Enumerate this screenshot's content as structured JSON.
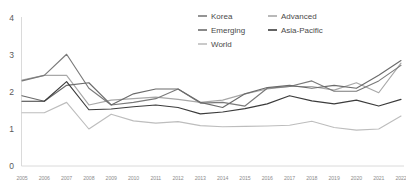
{
  "chart_data": {
    "type": "line",
    "title": "",
    "subtitle": "",
    "xlabel": "",
    "ylabel": "",
    "ylim": [
      0,
      4
    ],
    "yticks": [
      "0",
      "1",
      "2",
      "3",
      "4"
    ],
    "ytick_values": [
      0,
      1,
      2,
      3,
      4
    ],
    "grid": false,
    "legend_position": "top-center",
    "x": [
      "2005",
      "2006",
      "2007",
      "2008",
      "2009",
      "2010",
      "2011",
      "2012",
      "2013",
      "2014",
      "2015",
      "2016",
      "2017",
      "2018",
      "2019",
      "2020",
      "2021",
      "2022"
    ],
    "categories": [
      "2005",
      "2006",
      "2007",
      "2008",
      "2009",
      "2010",
      "2011",
      "2012",
      "2013",
      "2014",
      "2015",
      "2016",
      "2017",
      "2018",
      "2019",
      "2020",
      "2021",
      "2022"
    ],
    "series": [
      {
        "name": "Korea",
        "color": "#7a7a7a",
        "values": [
          2.3,
          2.45,
          3.02,
          2.1,
          1.65,
          1.72,
          1.82,
          2.08,
          1.7,
          1.72,
          1.62,
          2.1,
          2.15,
          2.3,
          2.02,
          2.02,
          2.3,
          2.72
        ]
      },
      {
        "name": "Advanced",
        "color": "#a8a8a8",
        "values": [
          2.32,
          2.45,
          2.45,
          1.65,
          1.78,
          1.82,
          1.86,
          1.8,
          1.72,
          1.78,
          1.95,
          2.08,
          2.15,
          2.15,
          2.05,
          2.25,
          1.98,
          2.78
        ]
      },
      {
        "name": "Emerging",
        "color": "#6b6b6b",
        "values": [
          1.9,
          1.75,
          2.18,
          2.25,
          1.65,
          1.95,
          2.08,
          2.08,
          1.72,
          1.58,
          1.95,
          2.12,
          2.18,
          2.1,
          2.18,
          2.1,
          2.45,
          2.85
        ]
      },
      {
        "name": "Asia-Pacific",
        "color": "#3c3c3c",
        "values": [
          1.75,
          1.75,
          2.28,
          1.52,
          1.54,
          1.6,
          1.65,
          1.58,
          1.41,
          1.46,
          1.55,
          1.68,
          1.9,
          1.76,
          1.68,
          1.78,
          1.62,
          1.8
        ]
      },
      {
        "name": "World",
        "color": "#bdbdbd",
        "values": [
          1.44,
          1.44,
          1.72,
          1.0,
          1.4,
          1.22,
          1.16,
          1.2,
          1.09,
          1.06,
          1.07,
          1.08,
          1.1,
          1.21,
          1.04,
          0.97,
          1.0,
          1.35
        ]
      }
    ]
  },
  "legend": {
    "entries": [
      {
        "label": "Korea",
        "color": "#7a7a7a"
      },
      {
        "label": "Advanced",
        "color": "#a8a8a8"
      },
      {
        "label": "Emerging",
        "color": "#6b6b6b"
      },
      {
        "label": "Asia-Pacific",
        "color": "#3c3c3c"
      },
      {
        "label": "World",
        "color": "#bdbdbd"
      }
    ]
  },
  "axes": {
    "y_labels": [
      "4",
      "3",
      "2",
      "1",
      "0"
    ]
  },
  "colors": {
    "axis": "#d6d6d6",
    "tick_text": "#5a5a5a",
    "xtick_text": "#8d8d8d",
    "legend_text": "#4a4a4a",
    "background": "#ffffff"
  }
}
